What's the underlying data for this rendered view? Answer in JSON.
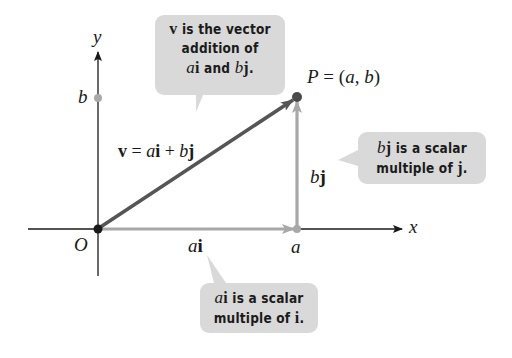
{
  "figure": {
    "axes": {
      "x_label": "x",
      "y_label": "y",
      "origin_label": "O",
      "a_tick_label": "a",
      "b_tick_label": "b"
    },
    "point": {
      "label_P": "P",
      "label_eq": " = (",
      "label_a": "a",
      "label_comma": ", ",
      "label_b": "b",
      "label_close": ")"
    },
    "vectors": {
      "v_equation": {
        "v": "v",
        "eq": " = ",
        "a": "a",
        "i": "i",
        "plus": " + ",
        "b": "b",
        "j": "j"
      },
      "ai_label": {
        "a": "a",
        "i": "i"
      },
      "bj_label": {
        "b": "b",
        "j": "j"
      }
    },
    "callouts": {
      "top": {
        "line1_v": "v",
        "line1_rest": " is the vector",
        "line2": "addition of",
        "line3_a": "a",
        "line3_i": "i",
        "line3_mid": " and ",
        "line3_b": "b",
        "line3_j": "j",
        "line3_end": "."
      },
      "right": {
        "line1_b": "b",
        "line1_j": "j",
        "line1_rest": " is a scalar",
        "line2": "multiple of ",
        "line2_j": "j",
        "line2_end": "."
      },
      "bottom": {
        "line1_a": "a",
        "line1_i": "i",
        "line1_rest": " is a scalar",
        "line2": "multiple of ",
        "line2_i": "i",
        "line2_end": "."
      }
    },
    "colors": {
      "axis": "#1a1a1a",
      "resultant_vector": "#555555",
      "component_vector": "#a8a8a8",
      "callout_fill": "#d9d9d9",
      "point_P": "#4a4a4a",
      "origin_dot": "#1a1a1a"
    }
  }
}
